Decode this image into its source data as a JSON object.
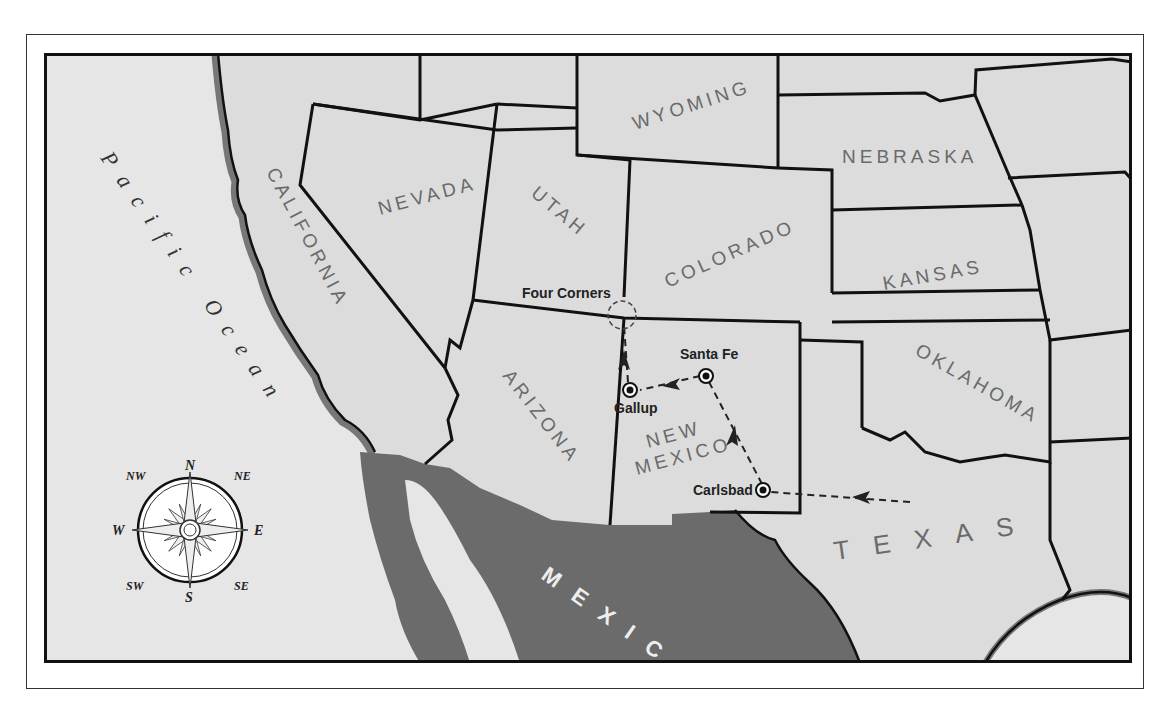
{
  "map": {
    "colors": {
      "land": "#dcdcdc",
      "ocean": "#e6e6e6",
      "mexico": "#6b6b6b",
      "border": "#111111",
      "coast_shadow": "#777777",
      "label": "#6a6a6a"
    },
    "states": [
      {
        "id": "california",
        "label": "CALIFORNIA"
      },
      {
        "id": "nevada",
        "label": "NEVADA"
      },
      {
        "id": "utah",
        "label": "UTAH"
      },
      {
        "id": "wyoming",
        "label": "WYOMING"
      },
      {
        "id": "colorado",
        "label": "COLORADO"
      },
      {
        "id": "nebraska",
        "label": "NEBRASKA"
      },
      {
        "id": "kansas",
        "label": "KANSAS"
      },
      {
        "id": "arizona",
        "label": "ARIZONA"
      },
      {
        "id": "new_mexico",
        "label_line1": "NEW",
        "label_line2": "MEXICO"
      },
      {
        "id": "oklahoma",
        "label": "OKLAHOMA"
      },
      {
        "id": "texas",
        "label": "TEXAS"
      }
    ],
    "countries": {
      "mexico": "MEXICO"
    },
    "water": {
      "pacific": "Pacific Ocean"
    },
    "landmarks": {
      "four_corners": "Four Corners"
    },
    "cities": [
      {
        "id": "santa_fe",
        "label": "Santa Fe"
      },
      {
        "id": "gallup",
        "label": "Gallup"
      },
      {
        "id": "carlsbad",
        "label": "Carlsbad"
      }
    ],
    "route": [
      "Texas (east)",
      "Carlsbad",
      "Santa Fe",
      "Gallup",
      "Four Corners"
    ],
    "compass": {
      "n": "N",
      "s": "S",
      "e": "E",
      "w": "W",
      "ne": "NE",
      "nw": "NW",
      "se": "SE",
      "sw": "SW"
    }
  }
}
